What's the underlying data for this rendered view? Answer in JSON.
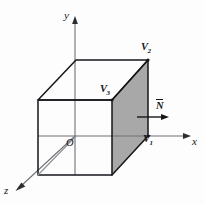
{
  "figure": {
    "background_color": "#fdfdfd",
    "line_color": "#15161a",
    "shade_color": "#a8a8a8",
    "width": 204,
    "height": 205
  },
  "axes": {
    "x_label": "x",
    "y_label": "y",
    "z_label": "z",
    "origin_label": "O",
    "origin_point": [
      75,
      136
    ],
    "x_tip": [
      190,
      136
    ],
    "y_tip": [
      75,
      18
    ],
    "z_tip": [
      15,
      191
    ]
  },
  "vertices": [
    {
      "name": "V1",
      "letter": "V",
      "index": "1",
      "point": [
        148,
        136
      ]
    },
    {
      "name": "V2",
      "letter": "V",
      "index": "2",
      "point": [
        148,
        60
      ]
    },
    {
      "name": "V3",
      "letter": "V",
      "index": "3",
      "point": [
        112,
        100
      ]
    }
  ],
  "normal": {
    "label": "N",
    "overbar": true,
    "arrow_start": [
      137,
      117
    ],
    "arrow_end": [
      169,
      117
    ]
  },
  "cube": {
    "front_top_left": [
      38,
      100
    ],
    "front_top_right": [
      112,
      100
    ],
    "front_bottom_left": [
      38,
      175
    ],
    "front_bottom_right": [
      112,
      175
    ],
    "back_top_left": [
      76,
      60
    ],
    "back_top_right": [
      148,
      60
    ],
    "back_bottom_right": [
      148,
      136
    ],
    "back_bottom_left": [
      76,
      96
    ]
  },
  "shaded_face": {
    "name": "right-face",
    "points": "148,60 112,100 112,175 148,136"
  }
}
